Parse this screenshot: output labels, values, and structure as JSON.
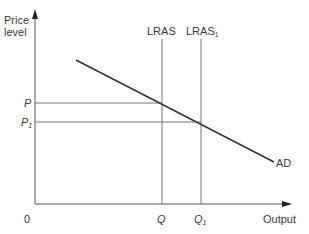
{
  "diagram": {
    "y_axis_label_line1": "Price",
    "y_axis_label_line2": "level",
    "x_axis_label": "Output",
    "origin_label": "0",
    "curves": {
      "lras": {
        "label": "LRAS",
        "sub": ""
      },
      "lras1": {
        "label": "LRAS",
        "sub": "1"
      },
      "ad": {
        "label": "AD"
      }
    },
    "price_levels": {
      "p": {
        "label": "P",
        "sub": ""
      },
      "p1": {
        "label": "P",
        "sub": "1"
      }
    },
    "outputs": {
      "q": {
        "label": "Q",
        "sub": ""
      },
      "q1": {
        "label": "Q",
        "sub": "1"
      }
    },
    "colors": {
      "axis": "#555555",
      "curve": "#333333",
      "guide": "#777777"
    }
  }
}
